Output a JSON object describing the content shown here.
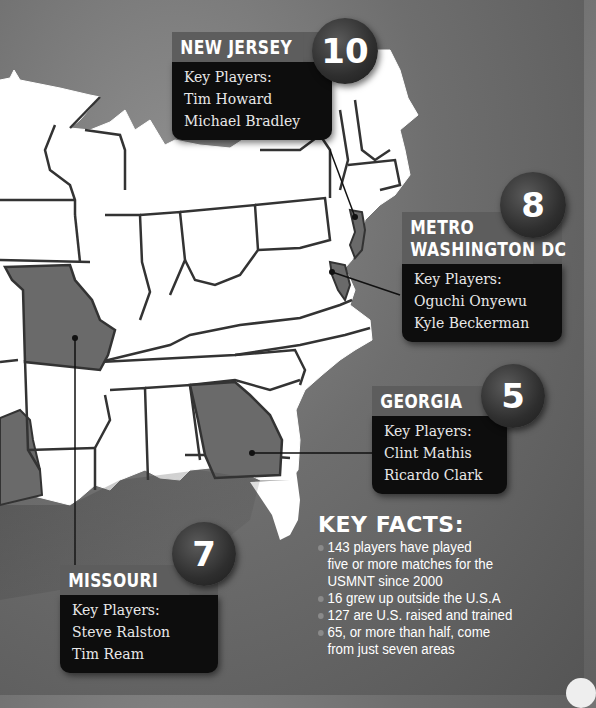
{
  "regions": [
    {
      "id": "new-jersey",
      "name": "NEW JERSEY",
      "count": "10",
      "label": "Key Players:",
      "players": [
        "Tim Howard",
        "Michael Bradley"
      ]
    },
    {
      "id": "metro-washington-dc",
      "name_lines": [
        "METRO",
        "WASHINGTON DC"
      ],
      "count": "8",
      "label": "Key Players:",
      "players": [
        "Oguchi Onyewu",
        "Kyle Beckerman"
      ]
    },
    {
      "id": "georgia",
      "name": "GEORGIA",
      "count": "5",
      "label": "Key Players:",
      "players": [
        "Clint Mathis",
        "Ricardo Clark"
      ]
    },
    {
      "id": "missouri",
      "name": "MISSOURI",
      "count": "7",
      "label": "Key Players:",
      "players": [
        "Steve Ralston",
        "Tim Ream"
      ]
    }
  ],
  "key_facts": {
    "title": "KEY FACTS:",
    "items": [
      "143 players have played five or more matches for the USMNT since 2000",
      "16 grew up outside the U.S.A",
      "127 are U.S. raised and trained",
      "65, or more than half, come from just seven areas"
    ]
  },
  "colors": {
    "background": "#6e6e6e",
    "highlight_state": "#6a6a6a",
    "map_fill": "#ffffff",
    "callout_head": "#5d5d5d",
    "callout_body": "#0d0d0d"
  }
}
